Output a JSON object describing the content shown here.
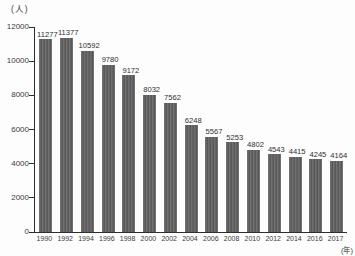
{
  "chart_data": {
    "type": "bar",
    "title": "",
    "ylabel": "(人)",
    "xlabel": "(年)",
    "categories": [
      "1990",
      "1992",
      "1994",
      "1996",
      "1998",
      "2000",
      "2002",
      "2004",
      "2006",
      "2008",
      "2010",
      "2012",
      "2014",
      "2016",
      "2017"
    ],
    "values": [
      11277,
      11377,
      10592,
      9780,
      9172,
      8032,
      7562,
      6248,
      5567,
      5253,
      4802,
      4543,
      4415,
      4245,
      4164
    ],
    "value_labels_shown": true,
    "ylim": [
      0,
      12000
    ],
    "yticks": [
      0,
      2000,
      4000,
      6000,
      8000,
      10000,
      12000
    ],
    "grid": false,
    "legend": "none",
    "bar_color": "#5c5c5c",
    "axis_color": "#2e2e2e",
    "text_color": "#3a3a3a",
    "background_color": "#fdfdfd"
  }
}
